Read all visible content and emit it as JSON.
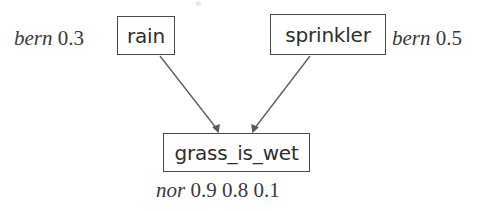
{
  "diagram": {
    "type": "bayesian-network",
    "title": "",
    "background_color": "#ffffff",
    "line_color": "#5a5a5a",
    "text_color": "#2e2e2e",
    "nodes": [
      {
        "id": "rain",
        "label": "rain",
        "cpd_keyword": "bern",
        "cpd_params": "0.3",
        "cpd_position": "left"
      },
      {
        "id": "sprinkler",
        "label": "sprinkler",
        "cpd_keyword": "bern",
        "cpd_params": "0.5",
        "cpd_position": "right"
      },
      {
        "id": "grass_is_wet",
        "label": "grass_is_wet",
        "cpd_keyword": "nor",
        "cpd_params": "0.9 0.8 0.1",
        "cpd_position": "below"
      }
    ],
    "edges": [
      {
        "from": "rain",
        "to": "grass_is_wet"
      },
      {
        "from": "sprinkler",
        "to": "grass_is_wet"
      }
    ]
  }
}
